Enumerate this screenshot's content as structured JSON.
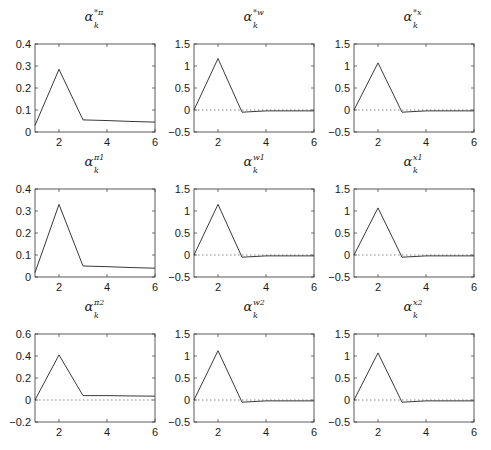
{
  "chart_data": [
    {
      "type": "line",
      "title": "α_k^{*π}",
      "title_base": "α",
      "title_sub": "k",
      "title_sup": "*π",
      "x": [
        1,
        2,
        3,
        4,
        5,
        6
      ],
      "series": [
        {
          "name": "alpha_k_star_pi",
          "values": [
            0.03,
            0.285,
            0.055,
            0.052,
            0.048,
            0.045
          ]
        }
      ],
      "xlim": [
        1,
        6
      ],
      "ylim": [
        0,
        0.4
      ],
      "xticks": [
        2,
        4,
        6
      ],
      "xtick_labels": [
        "2",
        "4",
        "6"
      ],
      "yticks": [
        0,
        0.1,
        0.2,
        0.3,
        0.4
      ],
      "ytick_labels": [
        "0",
        "0.1",
        "0.2",
        "0.3",
        "0.4"
      ],
      "zero_line": false,
      "grid": false,
      "xlabel": "",
      "ylabel": ""
    },
    {
      "type": "line",
      "title": "α_k^{*w}",
      "title_base": "α",
      "title_sub": "k",
      "title_sup": "*w",
      "x": [
        1,
        2,
        3,
        4,
        5,
        6
      ],
      "series": [
        {
          "name": "alpha_k_star_w",
          "values": [
            0.0,
            1.17,
            -0.05,
            -0.02,
            -0.02,
            -0.02
          ]
        }
      ],
      "xlim": [
        1,
        6
      ],
      "ylim": [
        -0.5,
        1.5
      ],
      "xticks": [
        2,
        4,
        6
      ],
      "xtick_labels": [
        "2",
        "4",
        "6"
      ],
      "yticks": [
        -0.5,
        0,
        0.5,
        1,
        1.5
      ],
      "ytick_labels": [
        "−0.5",
        "0",
        "0.5",
        "1",
        "1.5"
      ],
      "zero_line": true,
      "grid": false,
      "xlabel": "",
      "ylabel": ""
    },
    {
      "type": "line",
      "title": "α_k^{*x}",
      "title_base": "α",
      "title_sub": "k",
      "title_sup": "*x",
      "x": [
        1,
        2,
        3,
        4,
        5,
        6
      ],
      "series": [
        {
          "name": "alpha_k_star_x",
          "values": [
            0.0,
            1.07,
            -0.05,
            -0.02,
            -0.02,
            -0.02
          ]
        }
      ],
      "xlim": [
        1,
        6
      ],
      "ylim": [
        -0.5,
        1.5
      ],
      "xticks": [
        2,
        4,
        6
      ],
      "xtick_labels": [
        "2",
        "4",
        "6"
      ],
      "yticks": [
        -0.5,
        0,
        0.5,
        1,
        1.5
      ],
      "ytick_labels": [
        "−0.5",
        "0",
        "0.5",
        "1",
        "1.5"
      ],
      "zero_line": true,
      "grid": false,
      "xlabel": "",
      "ylabel": ""
    },
    {
      "type": "line",
      "title": "α_k^{π1}",
      "title_base": "α",
      "title_sub": "k",
      "title_sup": "π1",
      "x": [
        1,
        2,
        3,
        4,
        5,
        6
      ],
      "series": [
        {
          "name": "alpha_k_pi1",
          "values": [
            0.02,
            0.33,
            0.05,
            0.047,
            0.043,
            0.04
          ]
        }
      ],
      "xlim": [
        1,
        6
      ],
      "ylim": [
        0,
        0.4
      ],
      "xticks": [
        2,
        4,
        6
      ],
      "xtick_labels": [
        "2",
        "4",
        "6"
      ],
      "yticks": [
        0,
        0.1,
        0.2,
        0.3,
        0.4
      ],
      "ytick_labels": [
        "0",
        "0.1",
        "0.2",
        "0.3",
        "0.4"
      ],
      "zero_line": false,
      "grid": false,
      "xlabel": "",
      "ylabel": ""
    },
    {
      "type": "line",
      "title": "α_k^{w1}",
      "title_base": "α",
      "title_sub": "k",
      "title_sup": "w1",
      "x": [
        1,
        2,
        3,
        4,
        5,
        6
      ],
      "series": [
        {
          "name": "alpha_k_w1",
          "values": [
            0.0,
            1.15,
            -0.05,
            -0.02,
            -0.02,
            -0.02
          ]
        }
      ],
      "xlim": [
        1,
        6
      ],
      "ylim": [
        -0.5,
        1.5
      ],
      "xticks": [
        2,
        4,
        6
      ],
      "xtick_labels": [
        "2",
        "4",
        "6"
      ],
      "yticks": [
        -0.5,
        0,
        0.5,
        1,
        1.5
      ],
      "ytick_labels": [
        "−0.5",
        "0",
        "0.5",
        "1",
        "1.5"
      ],
      "zero_line": true,
      "grid": false,
      "xlabel": "",
      "ylabel": ""
    },
    {
      "type": "line",
      "title": "α_k^{x1}",
      "title_base": "α",
      "title_sub": "k",
      "title_sup": "x1",
      "x": [
        1,
        2,
        3,
        4,
        5,
        6
      ],
      "series": [
        {
          "name": "alpha_k_x1",
          "values": [
            0.0,
            1.07,
            -0.05,
            -0.02,
            -0.02,
            -0.02
          ]
        }
      ],
      "xlim": [
        1,
        6
      ],
      "ylim": [
        -0.5,
        1.5
      ],
      "xticks": [
        2,
        4,
        6
      ],
      "xtick_labels": [
        "2",
        "4",
        "6"
      ],
      "yticks": [
        -0.5,
        0,
        0.5,
        1,
        1.5
      ],
      "ytick_labels": [
        "−0.5",
        "0",
        "0.5",
        "1",
        "1.5"
      ],
      "zero_line": true,
      "grid": false,
      "xlabel": "",
      "ylabel": ""
    },
    {
      "type": "line",
      "title": "α_k^{π2}",
      "title_base": "α",
      "title_sub": "k",
      "title_sup": "π2",
      "x": [
        1,
        2,
        3,
        4,
        5,
        6
      ],
      "series": [
        {
          "name": "alpha_k_pi2",
          "values": [
            0.0,
            0.41,
            0.04,
            0.04,
            0.037,
            0.035
          ]
        }
      ],
      "xlim": [
        1,
        6
      ],
      "ylim": [
        -0.2,
        0.6
      ],
      "xticks": [
        2,
        4,
        6
      ],
      "xtick_labels": [
        "2",
        "4",
        "6"
      ],
      "yticks": [
        -0.2,
        0,
        0.2,
        0.4,
        0.6
      ],
      "ytick_labels": [
        "−0.2",
        "0",
        "0.2",
        "0.4",
        "0.6"
      ],
      "zero_line": true,
      "grid": false,
      "xlabel": "",
      "ylabel": ""
    },
    {
      "type": "line",
      "title": "α_k^{w2}",
      "title_base": "α",
      "title_sub": "k",
      "title_sup": "w2",
      "x": [
        1,
        2,
        3,
        4,
        5,
        6
      ],
      "series": [
        {
          "name": "alpha_k_w2",
          "values": [
            0.0,
            1.12,
            -0.05,
            -0.02,
            -0.02,
            -0.02
          ]
        }
      ],
      "xlim": [
        1,
        6
      ],
      "ylim": [
        -0.5,
        1.5
      ],
      "xticks": [
        2,
        4,
        6
      ],
      "xtick_labels": [
        "2",
        "4",
        "6"
      ],
      "yticks": [
        -0.5,
        0,
        0.5,
        1,
        1.5
      ],
      "ytick_labels": [
        "−0.5",
        "0",
        "0.5",
        "1",
        "1.5"
      ],
      "zero_line": true,
      "grid": false,
      "xlabel": "",
      "ylabel": ""
    },
    {
      "type": "line",
      "title": "α_k^{x2}",
      "title_base": "α",
      "title_sub": "k",
      "title_sup": "x2",
      "x": [
        1,
        2,
        3,
        4,
        5,
        6
      ],
      "series": [
        {
          "name": "alpha_k_x2",
          "values": [
            0.0,
            1.07,
            -0.05,
            -0.02,
            -0.02,
            -0.02
          ]
        }
      ],
      "xlim": [
        1,
        6
      ],
      "ylim": [
        -0.5,
        1.5
      ],
      "xticks": [
        2,
        4,
        6
      ],
      "xtick_labels": [
        "2",
        "4",
        "6"
      ],
      "yticks": [
        -0.5,
        0,
        0.5,
        1,
        1.5
      ],
      "ytick_labels": [
        "−0.5",
        "0",
        "0.5",
        "1",
        "1.5"
      ],
      "zero_line": true,
      "grid": false,
      "xlabel": "",
      "ylabel": ""
    }
  ],
  "colors": {
    "line": "#222222",
    "axes": "#333333",
    "zero_line": "#555555",
    "background": "#ffffff"
  }
}
